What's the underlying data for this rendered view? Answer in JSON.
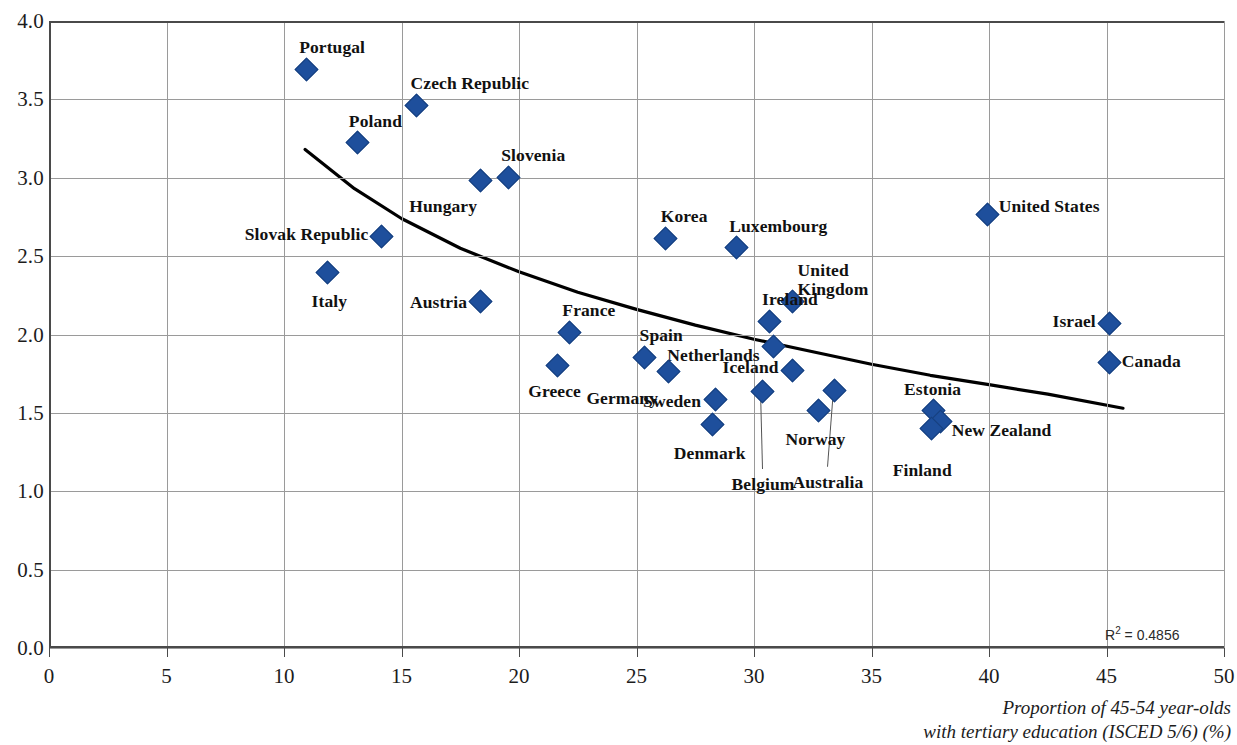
{
  "chart_data": {
    "type": "scatter",
    "title": "",
    "xlabel": "Proportion of 45-54 year-olds with tertiary education (ISCED 5/6) (%)",
    "xlabel_line1": "Proportion of 45-54 year-olds",
    "xlabel_line2": "with tertiary education (ISCED 5/6) (%)",
    "ylabel": "",
    "xlim": [
      0,
      50
    ],
    "ylim": [
      0,
      4.0
    ],
    "xticks": [
      0,
      5,
      10,
      15,
      20,
      25,
      30,
      35,
      40,
      45,
      50
    ],
    "yticks": [
      "0.0",
      "0.5",
      "1.0",
      "1.5",
      "2.0",
      "2.5",
      "3.0",
      "3.5",
      "4.0"
    ],
    "ytick_values": [
      0,
      0.5,
      1.0,
      1.5,
      2.0,
      2.5,
      3.0,
      3.5,
      4.0
    ],
    "grid": true,
    "legend": "none",
    "marker_color": "#1e4f9c",
    "trend_color": "#000000",
    "annotation_r2": "R² = 0.4856",
    "r2_value": 0.4856,
    "trendline": {
      "type": "power",
      "x_start": 10.9,
      "y_start": 3.18,
      "x_end": 45.7,
      "y_end": 1.53,
      "path_points": [
        [
          10.9,
          3.18
        ],
        [
          13.0,
          2.93
        ],
        [
          15.0,
          2.74
        ],
        [
          17.5,
          2.55
        ],
        [
          20.0,
          2.4
        ],
        [
          22.5,
          2.27
        ],
        [
          25.0,
          2.16
        ],
        [
          27.5,
          2.06
        ],
        [
          30.0,
          1.97
        ],
        [
          32.5,
          1.89
        ],
        [
          35.0,
          1.81
        ],
        [
          37.5,
          1.74
        ],
        [
          40.0,
          1.68
        ],
        [
          42.5,
          1.62
        ],
        [
          45.7,
          1.53
        ]
      ]
    },
    "points": [
      {
        "label": "Portugal",
        "x": 10.9,
        "y": 3.7,
        "label_dx": -6,
        "label_dy": -22,
        "label_anchor": "start"
      },
      {
        "label": "Czech Republic",
        "x": 15.6,
        "y": 3.47,
        "label_dx": -5,
        "label_dy": -22,
        "label_anchor": "start"
      },
      {
        "label": "Poland",
        "x": 13.1,
        "y": 3.23,
        "label_dx": -8,
        "label_dy": -22,
        "label_anchor": "start"
      },
      {
        "label": "Slovenia",
        "x": 19.5,
        "y": 3.01,
        "label_dx": -6,
        "label_dy": -22,
        "label_anchor": "start"
      },
      {
        "label": "Hungary",
        "x": 18.3,
        "y": 2.99,
        "label_dx": -2,
        "label_dy": 26,
        "label_anchor": "end"
      },
      {
        "label": "Slovak Republic",
        "x": 14.1,
        "y": 2.63,
        "label_dx": -12,
        "label_dy": -3,
        "label_anchor": "end"
      },
      {
        "label": "Italy",
        "x": 11.8,
        "y": 2.4,
        "label_dx": 3,
        "label_dy": 28,
        "label_anchor": "middle"
      },
      {
        "label": "Austria",
        "x": 18.3,
        "y": 2.22,
        "label_dx": -12,
        "label_dy": 1,
        "label_anchor": "end"
      },
      {
        "label": "Korea",
        "x": 26.2,
        "y": 2.62,
        "label_dx": -4,
        "label_dy": -22,
        "label_anchor": "start"
      },
      {
        "label": "Luxembourg",
        "x": 29.2,
        "y": 2.56,
        "label_dx": -6,
        "label_dy": -22,
        "label_anchor": "start"
      },
      {
        "label": "United States",
        "x": 39.9,
        "y": 2.77,
        "label_dx": 12,
        "label_dy": -9,
        "label_anchor": "start"
      },
      {
        "label": "United Kingdom",
        "x": 31.6,
        "y": 2.22,
        "label_dx": 6,
        "label_dy": -30,
        "label_anchor": "start",
        "two_line": true,
        "line1": "United",
        "line2": "Kingdom"
      },
      {
        "label": "Ireland",
        "x": 30.6,
        "y": 2.09,
        "label_dx": -6,
        "label_dy": -22,
        "label_anchor": "start"
      },
      {
        "label": "France",
        "x": 22.1,
        "y": 2.02,
        "label_dx": -6,
        "label_dy": -22,
        "label_anchor": "start"
      },
      {
        "label": "Israel",
        "x": 45.1,
        "y": 2.08,
        "label_dx": -13,
        "label_dy": -2,
        "label_anchor": "end"
      },
      {
        "label": "Spain",
        "x": 25.3,
        "y": 1.86,
        "label_dx": -4,
        "label_dy": -22,
        "label_anchor": "start"
      },
      {
        "label": "Netherlands",
        "x": 30.8,
        "y": 1.93,
        "label_dx": -13,
        "label_dy": 9,
        "label_anchor": "end"
      },
      {
        "label": "Canada",
        "x": 45.1,
        "y": 1.83,
        "label_dx": 13,
        "label_dy": -1,
        "label_anchor": "start"
      },
      {
        "label": "Greece",
        "x": 21.6,
        "y": 1.81,
        "label_dx": -2,
        "label_dy": 26,
        "label_anchor": "middle"
      },
      {
        "label": "Iceland",
        "x": 31.6,
        "y": 1.78,
        "label_dx": -13,
        "label_dy": -3,
        "label_anchor": "end"
      },
      {
        "label": "Germany",
        "x": 26.3,
        "y": 1.77,
        "label_dx": -9,
        "label_dy": 26,
        "label_anchor": "end"
      },
      {
        "label": "Belgium",
        "x": 30.3,
        "y": 1.64,
        "label_dx": 2,
        "label_dy": 92,
        "label_anchor": "middle",
        "leader": true
      },
      {
        "label": "Australia",
        "x": 33.4,
        "y": 1.65,
        "label_dx": -6,
        "label_dy": 92,
        "label_anchor": "middle",
        "leader": true
      },
      {
        "label": "Sweden",
        "x": 28.3,
        "y": 1.59,
        "label_dx": -13,
        "label_dy": 1,
        "label_anchor": "end"
      },
      {
        "label": "Estonia",
        "x": 37.6,
        "y": 1.52,
        "label_dx": 0,
        "label_dy": -22,
        "label_anchor": "middle"
      },
      {
        "label": "Norway",
        "x": 32.7,
        "y": 1.52,
        "label_dx": -2,
        "label_dy": 28,
        "label_anchor": "middle"
      },
      {
        "label": "New Zealand",
        "x": 37.9,
        "y": 1.45,
        "label_dx": 12,
        "label_dy": 8,
        "label_anchor": "start"
      },
      {
        "label": "Denmark",
        "x": 28.2,
        "y": 1.43,
        "label_dx": -2,
        "label_dy": 28,
        "label_anchor": "middle"
      },
      {
        "label": "Finland",
        "x": 37.5,
        "y": 1.41,
        "label_dx": -8,
        "label_dy": 42,
        "label_anchor": "middle"
      }
    ]
  }
}
